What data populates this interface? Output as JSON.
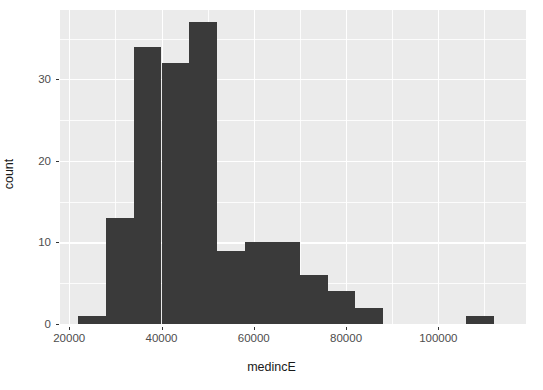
{
  "chart_data": {
    "type": "bar",
    "title": "",
    "subtitle": "",
    "xlabel": "medincE",
    "ylabel": "count",
    "grid": true,
    "legend": null,
    "xlim": [
      18000,
      119000
    ],
    "ylim": [
      0,
      38.5
    ],
    "x_ticks": [
      20000,
      40000,
      60000,
      80000,
      100000
    ],
    "x_tick_labels": [
      "20000",
      "40000",
      "60000",
      "80000",
      "100000"
    ],
    "x_minor_ticks": [
      30000,
      50000,
      70000,
      90000,
      110000
    ],
    "y_ticks": [
      0,
      10,
      20,
      30
    ],
    "y_tick_labels": [
      "0",
      "10",
      "20",
      "30"
    ],
    "y_minor_ticks": [
      5,
      15,
      25,
      35
    ],
    "bin_width": 6000,
    "bin_starts": [
      22000,
      28000,
      34000,
      40000,
      46000,
      52000,
      58000,
      64000,
      70000,
      76000,
      82000,
      88000,
      94000,
      100000,
      106000,
      112000
    ],
    "bin_centers": [
      25000,
      31000,
      37000,
      43000,
      49000,
      55000,
      61000,
      67000,
      73000,
      79000,
      85000,
      91000,
      97000,
      103000,
      109000,
      115000
    ],
    "values": [
      1,
      13,
      34,
      32,
      37,
      9,
      10,
      10,
      6,
      4,
      2,
      0,
      0,
      0,
      1,
      0
    ],
    "bar_color": "#3a3a3a",
    "panel_color": "#ebebeb",
    "grid_color": "#ffffff"
  },
  "axis": {
    "x_label": "medincE",
    "y_label": "count"
  }
}
